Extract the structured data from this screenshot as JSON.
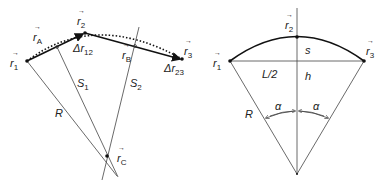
{
  "left_diagram": {
    "labels": {
      "r1": "r",
      "r1_sub": "1",
      "r2": "r",
      "r2_sub": "2",
      "r3": "r",
      "r3_sub": "3",
      "rA": "r",
      "rA_sub": "A",
      "rB": "r",
      "rB_sub": "B",
      "rC": "r",
      "rC_sub": "C",
      "dr12": "Δr",
      "dr12_sub": "12",
      "dr23": "Δr",
      "dr23_sub": "23",
      "S1": "S",
      "S1_sub": "1",
      "S2": "S",
      "S2_sub": "2",
      "R": "R"
    },
    "vector_mark": "→"
  },
  "right_diagram": {
    "labels": {
      "r1": "r",
      "r1_sub": "1",
      "r2": "r",
      "r2_sub": "2",
      "r3": "r",
      "r3_sub": "3",
      "s": "s",
      "L2": "L/2",
      "h": "h",
      "R": "R",
      "alpha_left": "α",
      "alpha_right": "α"
    },
    "vector_mark": "→"
  },
  "colors": {
    "line": "#444444",
    "thick": "#111111",
    "text": "#222222"
  }
}
